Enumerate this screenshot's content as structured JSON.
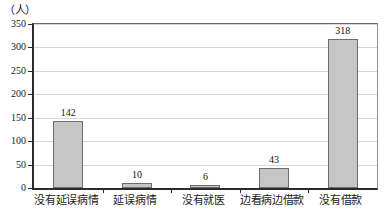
{
  "chart_data": {
    "type": "bar",
    "title": "",
    "subtitle": "",
    "xlabel": "",
    "ylabel": "（人）",
    "unit_label": "（人）",
    "categories": [
      "没有延误病情",
      "延误病情",
      "没有就医",
      "边看病边借款",
      "没有借款"
    ],
    "values": [
      142,
      10,
      6,
      43,
      318
    ],
    "series": [
      {
        "name": "人数",
        "values": [
          142,
          10,
          6,
          43,
          318
        ]
      }
    ],
    "ylim": [
      0,
      350
    ],
    "ytick_labels": [
      "0",
      "50",
      "100",
      "150",
      "200",
      "250",
      "300",
      "350"
    ],
    "ytick_values": [
      0,
      50,
      100,
      150,
      200,
      250,
      300,
      350
    ],
    "grid": true,
    "grid_axis": "y",
    "legend": false,
    "legend_position": "none",
    "bar_fill_color": "#c6c6c6",
    "bar_border_color": "#6d6d6d",
    "axis_color": "#2b2b2b",
    "gridline_color": "#d8d8d8",
    "background_color": "#ffffff",
    "data_labels": [
      "142",
      "10",
      "6",
      "43",
      "318"
    ]
  }
}
